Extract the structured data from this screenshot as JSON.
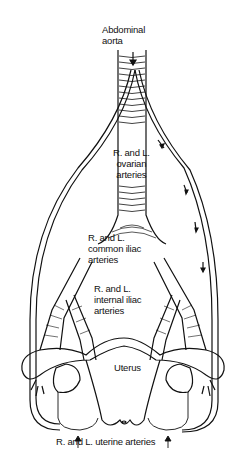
{
  "diagram": {
    "type": "anatomical-illustration",
    "labels": {
      "abdominal_aorta": [
        "Abdominal",
        "aorta"
      ],
      "ovarian_arteries": [
        "R. and L.",
        "ovarian",
        "arteries"
      ],
      "common_iliac": [
        "R. and L.",
        "common iliac",
        "arteries"
      ],
      "internal_iliac": [
        "R. and L.",
        "internal iliac",
        "arteries"
      ],
      "uterus": "Uterus",
      "uterine_arteries": "R. and L. uterine arteries"
    },
    "colors": {
      "line": "#111111",
      "background": "#ffffff"
    }
  }
}
